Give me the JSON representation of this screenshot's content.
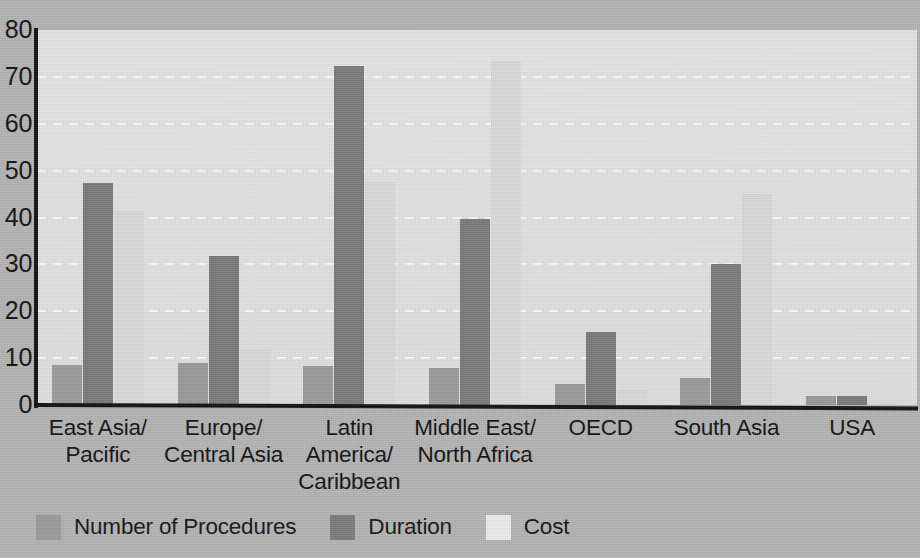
{
  "chart_data": {
    "type": "bar",
    "title": "",
    "subtitle": "",
    "xlabel": "",
    "ylabel": "",
    "ylim": [
      0,
      80
    ],
    "ytick_labels": [
      "0",
      "10",
      "20",
      "30",
      "40",
      "50",
      "60",
      "70",
      "80"
    ],
    "ytick_values": [
      0,
      10,
      20,
      30,
      40,
      50,
      60,
      70,
      80
    ],
    "grid": true,
    "grid_style": "dashed-white-horizontal",
    "legend_position": "bottom-left",
    "categories": [
      "East Asia/\nPacific",
      "Europe/\nCentral Asia",
      "Latin\nAmerica/\nCaribbean",
      "Middle East/\nNorth Africa",
      "OECD",
      "South Asia",
      "USA"
    ],
    "series": [
      {
        "name": "Number of Procedures",
        "color": "#9a9a9a",
        "values": [
          8.5,
          9.0,
          8.3,
          7.9,
          4.5,
          5.8,
          2.0
        ]
      },
      {
        "name": "Duration",
        "color": "#7a7a7a",
        "values": [
          47.4,
          31.7,
          72.4,
          39.6,
          15.5,
          30.0,
          2.0
        ]
      },
      {
        "name": "Cost",
        "color": "#d9d9d9",
        "values": [
          41.4,
          12.0,
          47.5,
          73.3,
          3.2,
          45.0,
          0.7
        ]
      }
    ]
  },
  "legend": {
    "items": [
      {
        "label": "Number of Procedures",
        "swatch": "procedures"
      },
      {
        "label": "Duration",
        "swatch": "duration"
      },
      {
        "label": "Cost",
        "swatch": "cost"
      }
    ]
  },
  "colors": {
    "page_background": "#b3b3b3",
    "plot_background": "#e2e2e2",
    "axis": "#111111",
    "gridline": "#f6f6f6",
    "series_procedures": "#9a9a9a",
    "series_duration": "#7a7a7a",
    "series_cost": "#d9d9d9",
    "text": "#111111"
  }
}
